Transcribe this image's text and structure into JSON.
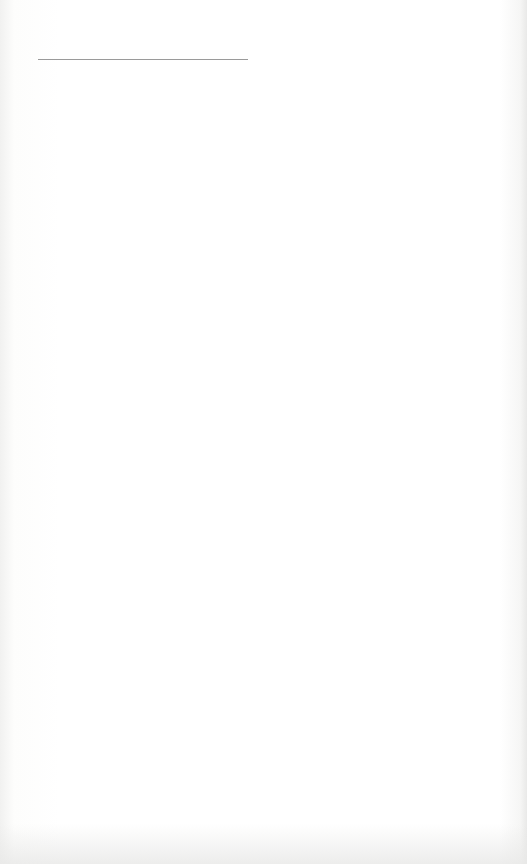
{
  "page": {
    "type": "blank lined paper",
    "header_line": {
      "visible": true
    },
    "ruled_lines": {
      "count": 21
    },
    "text": ""
  }
}
